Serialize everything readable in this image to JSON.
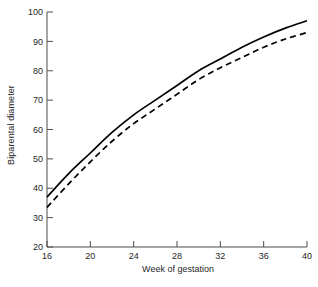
{
  "chart_data": {
    "type": "line",
    "title": "",
    "xlabel": "Week of gestation",
    "ylabel": "Biparental diameter",
    "xlim": [
      16,
      40
    ],
    "ylim": [
      20,
      100
    ],
    "xticks": [
      16,
      20,
      24,
      28,
      32,
      36,
      40
    ],
    "yticks": [
      20,
      30,
      40,
      50,
      60,
      70,
      80,
      90,
      100
    ],
    "grid": false,
    "legend": "none",
    "x": [
      16,
      18,
      20,
      22,
      24,
      26,
      28,
      30,
      32,
      34,
      36,
      38,
      40
    ],
    "series": [
      {
        "name": "solid",
        "style": "solid",
        "color": "#000000",
        "values": [
          37,
          45,
          52,
          59,
          65,
          70,
          75,
          80,
          84,
          88,
          91.5,
          94.5,
          97
        ]
      },
      {
        "name": "dashed",
        "style": "dashed",
        "color": "#000000",
        "values": [
          33.5,
          41.5,
          49,
          56,
          62,
          67,
          72,
          77,
          81,
          84.5,
          88,
          90.8,
          93
        ]
      }
    ]
  },
  "axes": {
    "x_tick_labels": [
      "16",
      "20",
      "24",
      "28",
      "32",
      "36",
      "40"
    ],
    "y_tick_labels": [
      "20",
      "30",
      "40",
      "50",
      "60",
      "70",
      "80",
      "90",
      "100"
    ],
    "x_axis_title": "Week of gestation",
    "y_axis_title": "Biparental diameter"
  }
}
